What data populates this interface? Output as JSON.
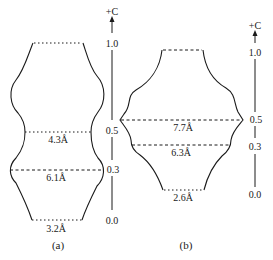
{
  "figure_a": {
    "caption": "(a)",
    "axis": {
      "label": "+C",
      "ticks": [
        "1.0",
        "0.5",
        "0.3",
        "0.0"
      ]
    },
    "widths": [
      "4.3Å",
      "6.1Å",
      "3.2Å"
    ]
  },
  "figure_b": {
    "caption": "(b)",
    "axis": {
      "label": "+C",
      "ticks": [
        "1.0",
        "0.5",
        "0.3",
        "0.0"
      ]
    },
    "widths": [
      "7.7Å",
      "6.3Å",
      "2.6Å"
    ]
  }
}
